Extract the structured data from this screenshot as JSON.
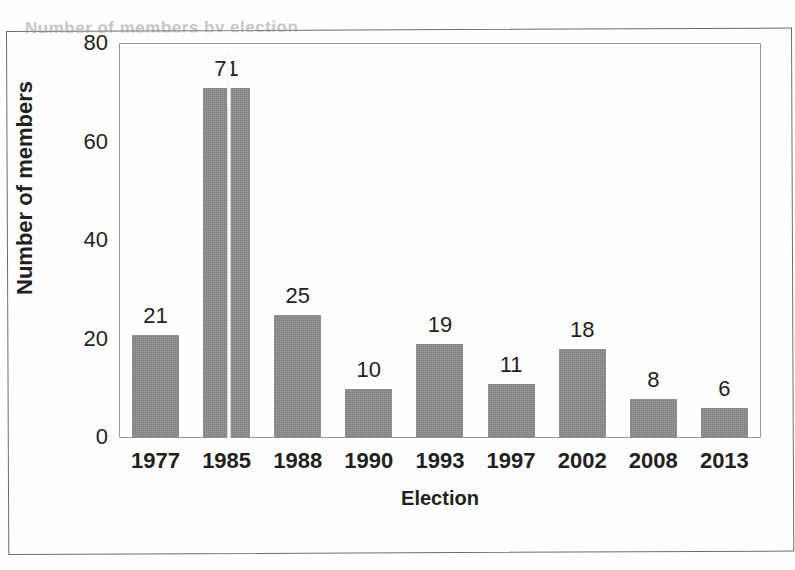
{
  "page": {
    "clipped_title_fragment": "Number of members by election",
    "background_color": "#ffffff",
    "frame_color": "#6e6e6e"
  },
  "chart_data": {
    "type": "bar",
    "title": "",
    "xlabel": "Election",
    "ylabel": "Number of members",
    "categories": [
      "1977",
      "1985",
      "1988",
      "1990",
      "1993",
      "1997",
      "2002",
      "2008",
      "2013"
    ],
    "values": [
      21,
      71,
      25,
      10,
      19,
      11,
      18,
      8,
      6
    ],
    "data_labels": [
      "21",
      "71",
      "25",
      "10",
      "19",
      "11",
      "18",
      "8",
      "6"
    ],
    "ylim": [
      0,
      80
    ],
    "ytick_values": [
      80,
      60,
      40,
      20,
      0
    ],
    "ytick_labels": [
      "80",
      "60",
      "40",
      "20",
      "0"
    ],
    "grid": false,
    "legend": false,
    "legend_position": "none",
    "bar_color": "#8b8b8b",
    "plot_border_color": "#9b9b9b",
    "text_color": "#231f20",
    "annotations": [
      "white vertical scan-fold line through the 1985 bar"
    ]
  }
}
